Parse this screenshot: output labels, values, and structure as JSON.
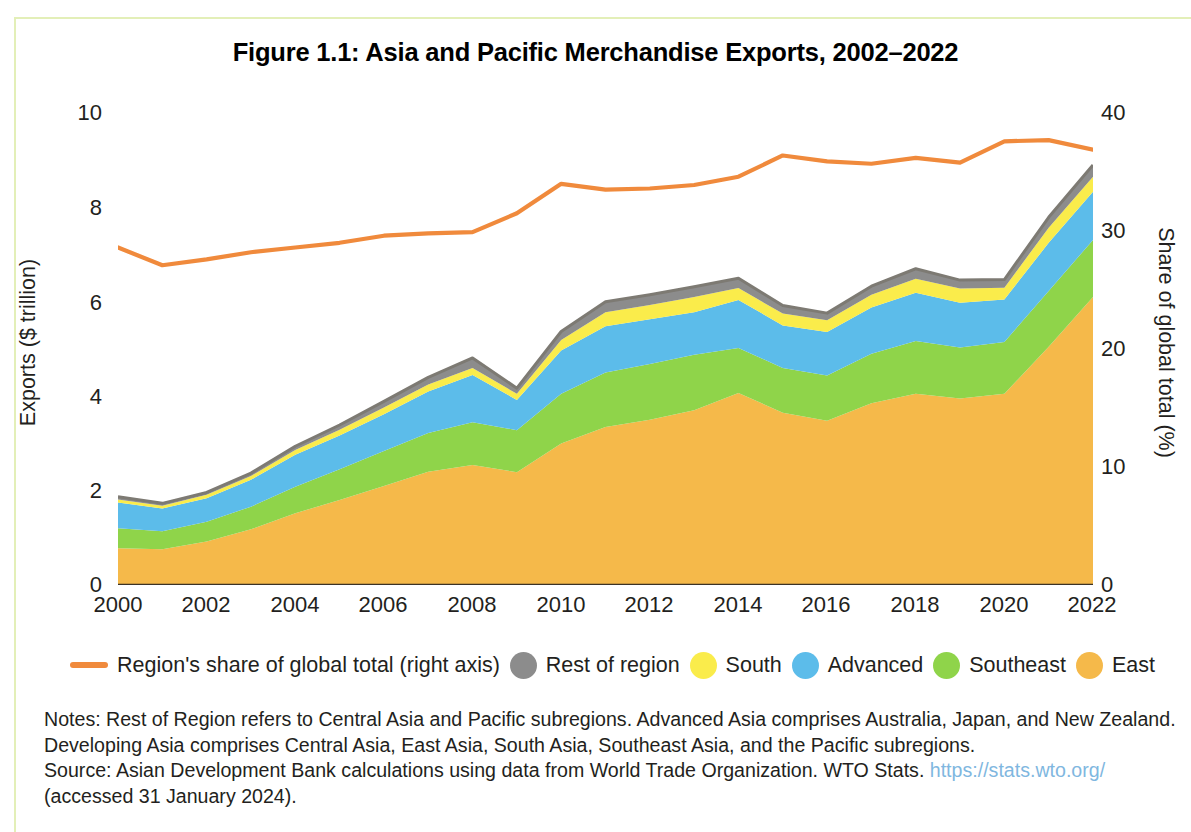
{
  "figure": {
    "title": "Figure 1.1: Asia and Pacific Merchandise Exports, 2002–2022"
  },
  "axes": {
    "left_label": "Exports ($ trillion)",
    "right_label": "Share of global total (%)",
    "left_ticks": [
      "10",
      "8",
      "6",
      "4",
      "2",
      "0"
    ],
    "right_ticks": [
      "40",
      "30",
      "20",
      "10",
      "0"
    ],
    "x_ticks": [
      "2000",
      "2002",
      "2004",
      "2006",
      "2008",
      "2010",
      "2012",
      "2014",
      "2016",
      "2018",
      "2020",
      "2022"
    ]
  },
  "legend": {
    "items": [
      {
        "label": "Region's share of global total (right axis)",
        "marker": "line",
        "color": "#F08A3C",
        "icon": "line-marker-icon"
      },
      {
        "label": "Rest of region",
        "marker": "dot",
        "color": "#8C8C8C",
        "icon": "circle-marker-icon"
      },
      {
        "label": "South",
        "marker": "dot",
        "color": "#FAEC4B",
        "icon": "circle-marker-icon"
      },
      {
        "label": "Advanced",
        "marker": "dot",
        "color": "#5CBCEA",
        "icon": "circle-marker-icon"
      },
      {
        "label": "Southeast",
        "marker": "dot",
        "color": "#8FD44A",
        "icon": "circle-marker-icon"
      },
      {
        "label": "East",
        "marker": "dot",
        "color": "#F5B94A",
        "icon": "circle-marker-icon"
      }
    ]
  },
  "notes": {
    "line1": "Notes: Rest of Region refers to Central Asia and Pacific subregions. Advanced Asia comprises Australia, Japan, and New Zealand.",
    "line2": "Developing Asia comprises Central Asia, East Asia, South Asia, Southeast Asia, and the Pacific subregions.",
    "line3_prefix": "Source: Asian Development Bank calculations using data from World Trade Organization. WTO Stats. ",
    "line3_url": "https://stats.wto.org/",
    "line4": "(accessed 31 January 2024)."
  },
  "chart_data": {
    "type": "area",
    "title": "Figure 1.1: Asia and Pacific Merchandise Exports, 2002–2022",
    "xlabel": "",
    "ylabel": "Exports ($ trillion)",
    "y2label": "Share of global total (%)",
    "ylim": [
      0,
      10
    ],
    "y2lim": [
      0,
      40
    ],
    "xlim": [
      2000,
      2022
    ],
    "grid": false,
    "legend_position": "bottom",
    "stacked": true,
    "x": [
      2000,
      2001,
      2002,
      2003,
      2004,
      2005,
      2006,
      2007,
      2008,
      2009,
      2010,
      2011,
      2012,
      2013,
      2014,
      2015,
      2016,
      2017,
      2018,
      2019,
      2020,
      2021,
      2022
    ],
    "series": [
      {
        "name": "East",
        "color": "#F5B94A",
        "axis": "left",
        "values": [
          0.78,
          0.76,
          0.92,
          1.18,
          1.52,
          1.8,
          2.1,
          2.4,
          2.54,
          2.39,
          3.0,
          3.35,
          3.5,
          3.7,
          4.07,
          3.65,
          3.48,
          3.85,
          4.05,
          3.95,
          4.05,
          5.05,
          6.1
        ]
      },
      {
        "name": "Southeast",
        "color": "#8FD44A",
        "axis": "left",
        "values": [
          0.42,
          0.38,
          0.42,
          0.48,
          0.56,
          0.65,
          0.74,
          0.82,
          0.91,
          0.89,
          1.05,
          1.15,
          1.18,
          1.18,
          0.95,
          0.95,
          0.96,
          1.05,
          1.12,
          1.08,
          1.1,
          1.18,
          1.21
        ]
      },
      {
        "name": "Advanced",
        "color": "#5CBCEA",
        "axis": "left",
        "values": [
          0.55,
          0.48,
          0.5,
          0.57,
          0.68,
          0.72,
          0.78,
          0.88,
          1.0,
          0.64,
          0.92,
          0.98,
          0.95,
          0.9,
          1.02,
          0.9,
          0.92,
          0.98,
          1.02,
          0.95,
          0.9,
          1.02,
          1.02
        ]
      },
      {
        "name": "South",
        "color": "#FAEC4B",
        "axis": "left",
        "values": [
          0.06,
          0.06,
          0.07,
          0.08,
          0.1,
          0.12,
          0.14,
          0.15,
          0.15,
          0.13,
          0.22,
          0.3,
          0.3,
          0.32,
          0.25,
          0.25,
          0.25,
          0.27,
          0.3,
          0.3,
          0.25,
          0.32,
          0.32
        ]
      },
      {
        "name": "Rest of region",
        "color": "#8C8C8C",
        "axis": "left",
        "values": [
          0.06,
          0.05,
          0.05,
          0.06,
          0.08,
          0.1,
          0.13,
          0.15,
          0.21,
          0.12,
          0.18,
          0.22,
          0.22,
          0.22,
          0.21,
          0.17,
          0.15,
          0.18,
          0.21,
          0.18,
          0.17,
          0.22,
          0.25
        ]
      },
      {
        "name": "Region's share of global total (right axis)",
        "color": "#F08A3C",
        "axis": "right",
        "type": "line",
        "values": [
          28.6,
          27.1,
          27.6,
          28.2,
          28.6,
          29.0,
          29.6,
          29.8,
          29.9,
          31.5,
          34.0,
          33.5,
          33.6,
          33.9,
          34.6,
          36.4,
          35.9,
          35.7,
          36.2,
          35.8,
          37.6,
          37.7,
          36.9
        ]
      }
    ]
  }
}
